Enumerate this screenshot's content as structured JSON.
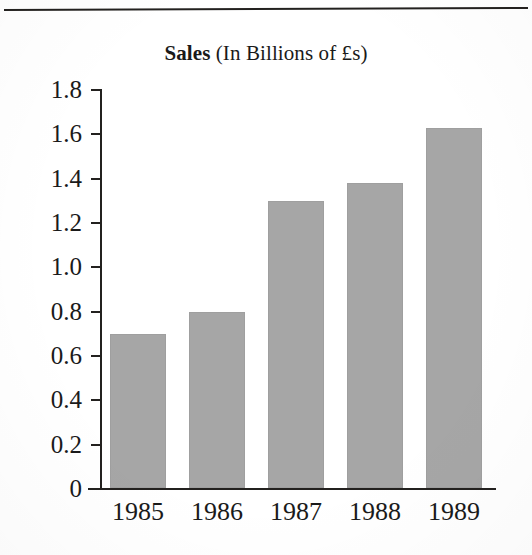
{
  "figure": {
    "top_rule": true,
    "background_color": "#ffffff",
    "ink_color": "#23211f"
  },
  "title": {
    "bold_part": "Sales",
    "regular_part": " (In Billions of £s)",
    "full": "Sales (In Billions of £s)"
  },
  "chart_data": {
    "type": "bar",
    "title": "Sales (In Billions of £s)",
    "xlabel": "",
    "ylabel": "",
    "categories": [
      "1985",
      "1986",
      "1987",
      "1988",
      "1989"
    ],
    "values": [
      0.7,
      0.8,
      1.3,
      1.38,
      1.63
    ],
    "series": [
      {
        "name": "Sales",
        "values": [
          0.7,
          0.8,
          1.3,
          1.38,
          1.63
        ],
        "color": "#a6a6a6"
      }
    ],
    "ylim": [
      0,
      1.8
    ],
    "ytick_values": [
      1.8,
      1.6,
      1.4,
      1.2,
      1.0,
      0.8,
      0.6,
      0.4,
      0.2,
      0
    ],
    "ytick_labels": [
      "1.8",
      "1.6",
      "1.4",
      "1.2",
      "1.0",
      "0.8",
      "0.6",
      "0.4",
      "0.2",
      "0"
    ],
    "grid": false,
    "legend": null,
    "legend_position": "none",
    "units": "Billions of £s"
  },
  "axis": {
    "y_ticks": [
      {
        "label": "1.8",
        "value": 1.8
      },
      {
        "label": "1.6",
        "value": 1.6
      },
      {
        "label": "1.4",
        "value": 1.4
      },
      {
        "label": "1.2",
        "value": 1.2
      },
      {
        "label": "1.0",
        "value": 1.0
      },
      {
        "label": "0.8",
        "value": 0.8
      },
      {
        "label": "0.6",
        "value": 0.6
      },
      {
        "label": "0.4",
        "value": 0.4
      },
      {
        "label": "0.2",
        "value": 0.2
      },
      {
        "label": "0",
        "value": 0
      }
    ],
    "x_labels": [
      "1985",
      "1986",
      "1987",
      "1988",
      "1989"
    ]
  }
}
